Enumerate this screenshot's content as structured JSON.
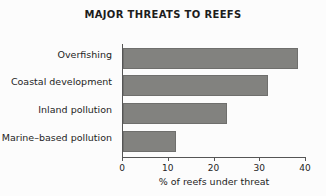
{
  "chart_data": {
    "type": "bar",
    "orientation": "horizontal",
    "title": "MAJOR THREATS TO REEFS",
    "xlabel": "% of reefs under threat",
    "ylabel": "",
    "categories": [
      "Overfishing",
      "Coastal development",
      "Inland pollution",
      "Marine–based pollution"
    ],
    "values": [
      38.3,
      31.8,
      22.8,
      11.6
    ],
    "xlim": [
      0,
      40
    ],
    "xticks": [
      0,
      10,
      20,
      30,
      40
    ],
    "xtick_labels": [
      "0",
      "10",
      "20",
      "30",
      "40"
    ],
    "grid": false,
    "legend": null,
    "series": [
      {
        "name": "% of reefs under threat",
        "values": [
          38.3,
          31.8,
          22.8,
          11.6
        ]
      }
    ]
  },
  "style": {
    "bar_fill": "#82827f",
    "bar_edge": "#6f6f6d",
    "axis_color": "#555555",
    "text_color": "#242424",
    "title_color": "#1d1d1d",
    "background": "#fcfcfc"
  }
}
